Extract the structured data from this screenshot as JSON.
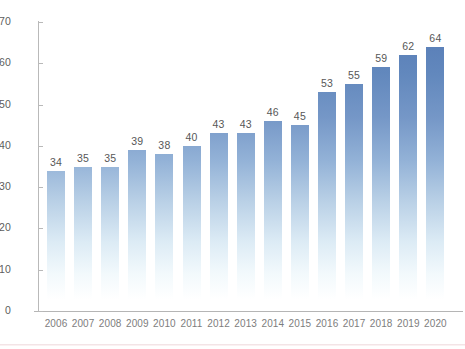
{
  "chart_data": {
    "type": "bar",
    "title": "",
    "subtitle": "",
    "xlabel": "",
    "ylabel": "",
    "categories": [
      "2006",
      "2007",
      "2008",
      "2009",
      "2010",
      "2011",
      "2012",
      "2013",
      "2014",
      "2015",
      "2016",
      "2017",
      "2018",
      "2019",
      "2020"
    ],
    "values": [
      34,
      35,
      35,
      39,
      38,
      40,
      43,
      43,
      46,
      45,
      53,
      55,
      59,
      62,
      64
    ],
    "data_labels": [
      "34",
      "35",
      "35",
      "39",
      "38",
      "40",
      "43",
      "43",
      "46",
      "45",
      "53",
      "55",
      "59",
      "62",
      "64"
    ],
    "ylim": [
      0,
      70
    ],
    "yticks": [
      0,
      10,
      20,
      30,
      40,
      50,
      60,
      70
    ],
    "ytick_labels": [
      "0",
      "10",
      "20",
      "30",
      "40",
      "50",
      "60",
      "70"
    ],
    "grid": false,
    "legend": null,
    "legend_position": "none",
    "bar_color_top": "#5379b4",
    "bar_color_bottom": "#ffffff",
    "axis_color": "#b9b9b9",
    "label_color": "#575757",
    "tick_label_color": "#7d7d7d",
    "background": "#ffffff"
  }
}
